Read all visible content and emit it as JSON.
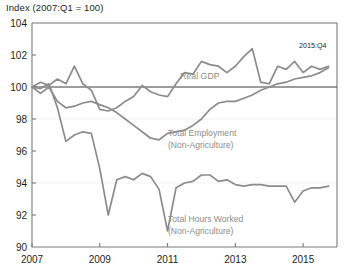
{
  "chart": {
    "title": "Index (2007:Q1 = 100)",
    "end_annotation": "2015:Q4"
  },
  "labels": {
    "gdp": "Real GDP",
    "employment_l1": "Total Employment",
    "employment_l2": "(Non-Agriculture)",
    "hours_l1": "Total Hours Worked",
    "hours_l2": "(Non-Agriculture)"
  },
  "colors": {
    "series": "#8c8c8c",
    "label": "#8d8d8d",
    "axis": "#7a7a7a",
    "baseline": "#3a3a3a",
    "background": "#ffffff"
  },
  "chart_data": {
    "type": "line",
    "title": "Index (2007:Q1 = 100)",
    "xlabel": "",
    "ylabel": "Index (2007:Q1 = 100)",
    "xlim": [
      2007.0,
      2016.0
    ],
    "ylim": [
      90,
      104
    ],
    "yticks": [
      90,
      92,
      94,
      96,
      98,
      100,
      102,
      104
    ],
    "xticks": [
      2007,
      2009,
      2011,
      2013,
      2015
    ],
    "xtick_labels": [
      "2007",
      "2009",
      "2011",
      "2013",
      "2015"
    ],
    "ytick_labels": [
      "90",
      "92",
      "94",
      "96",
      "98",
      "100",
      "102",
      "104"
    ],
    "grid": false,
    "legend": "inline-annotations",
    "reference_line": {
      "value": 100,
      "label": "100 index baseline"
    },
    "annotations": [
      {
        "text": "Real GDP",
        "x": 2012.0,
        "y": 101.0
      },
      {
        "text": "Total Employment (Non-Agriculture)",
        "x": 2012.2,
        "y": 97.4
      },
      {
        "text": "Total Hours Worked (Non-Agriculture)",
        "x": 2012.2,
        "y": 92.6
      },
      {
        "text": "2015:Q4",
        "x": 2015.7,
        "y": 102.9
      }
    ],
    "x": [
      2007.0,
      2007.25,
      2007.5,
      2007.75,
      2008.0,
      2008.25,
      2008.5,
      2008.75,
      2009.0,
      2009.25,
      2009.5,
      2009.75,
      2010.0,
      2010.25,
      2010.5,
      2010.75,
      2011.0,
      2011.25,
      2011.5,
      2011.75,
      2012.0,
      2012.25,
      2012.5,
      2012.75,
      2013.0,
      2013.25,
      2013.5,
      2013.75,
      2014.0,
      2014.25,
      2014.5,
      2014.75,
      2015.0,
      2015.25,
      2015.5,
      2015.75
    ],
    "series": [
      {
        "name": "Real GDP",
        "values": [
          100.0,
          100.3,
          100.1,
          100.5,
          100.2,
          101.3,
          100.2,
          99.8,
          98.6,
          98.5,
          98.7,
          99.1,
          99.4,
          100.1,
          99.7,
          99.5,
          99.4,
          100.2,
          100.9,
          100.8,
          101.6,
          101.4,
          101.3,
          100.9,
          101.3,
          101.9,
          102.4,
          100.3,
          100.2,
          101.3,
          101.1,
          101.6,
          100.9,
          101.3,
          101.1,
          101.3
        ]
      },
      {
        "name": "Total Employment (Non-Agriculture)",
        "values": [
          100.0,
          99.6,
          100.0,
          99.1,
          98.7,
          98.8,
          99.0,
          99.1,
          98.9,
          98.7,
          98.4,
          98.0,
          97.6,
          97.2,
          96.8,
          96.7,
          97.1,
          97.2,
          97.3,
          97.6,
          98.0,
          98.6,
          99.0,
          99.1,
          99.1,
          99.3,
          99.5,
          99.8,
          100.0,
          100.2,
          100.3,
          100.5,
          100.6,
          100.7,
          100.9,
          101.2
        ]
      },
      {
        "name": "Total Hours Worked (Non-Agriculture)",
        "values": [
          100.0,
          99.9,
          100.2,
          98.7,
          96.6,
          97.0,
          97.2,
          97.1,
          94.9,
          92.0,
          94.2,
          94.4,
          94.2,
          94.6,
          94.4,
          93.6,
          91.0,
          93.7,
          94.0,
          94.1,
          94.5,
          94.5,
          94.1,
          94.2,
          93.9,
          93.8,
          93.9,
          93.9,
          93.8,
          93.8,
          93.8,
          92.8,
          93.5,
          93.7,
          93.7,
          93.8
        ]
      }
    ]
  }
}
